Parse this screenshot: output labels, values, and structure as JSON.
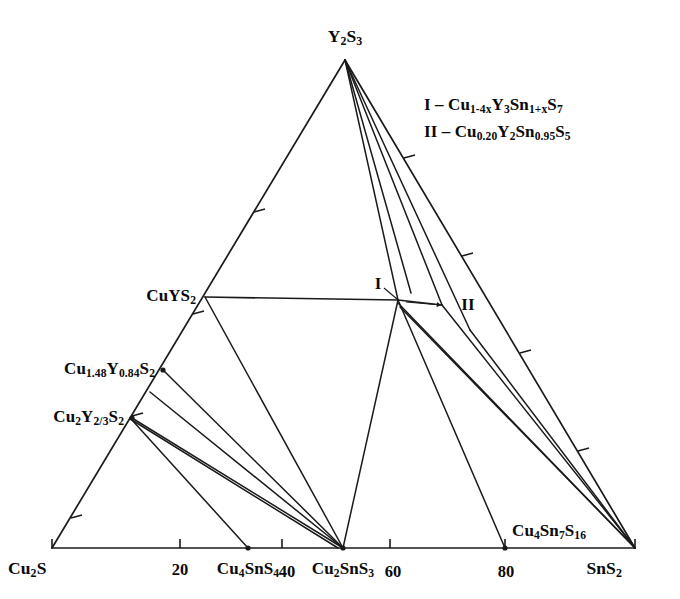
{
  "figure": {
    "kind": "ternary-phase-diagram",
    "system": "Cu2S - Y2S3 - SnS2",
    "background_color": "#ffffff",
    "line_color": "#1a1a1a"
  },
  "corners": [
    {
      "id": "cu2s",
      "name": "Cu2S",
      "html": "Cu<sub>2</sub>S",
      "x": 52,
      "y": 548,
      "label_x": 8,
      "label_y": 570,
      "anchor": "l"
    },
    {
      "id": "y2s3",
      "name": "Y2S3",
      "html": "Y<sub>2</sub>S<sub>3</sub>",
      "x": 345,
      "y": 60,
      "label_x": 345,
      "label_y": 38,
      "anchor": "c"
    },
    {
      "id": "sns2",
      "name": "SnS2",
      "html": "SnS<sub>2</sub>",
      "x": 635,
      "y": 548,
      "label_x": 622,
      "label_y": 570,
      "anchor": "r"
    }
  ],
  "axis_ticks": [
    {
      "value": "20",
      "x": 180,
      "y": 548,
      "label_x": 180,
      "label_y": 570
    },
    {
      "value": "40",
      "x": 282,
      "y": 548,
      "label_x": 287,
      "label_y": 572
    },
    {
      "value": "60",
      "x": 390,
      "y": 548,
      "label_x": 393,
      "label_y": 572
    },
    {
      "value": "80",
      "x": 505,
      "y": 548,
      "label_x": 506,
      "label_y": 572
    }
  ],
  "phase_points": [
    {
      "id": "cuys2",
      "html": "CuYS<sub>2</sub>",
      "x": 205,
      "y": 297,
      "label_x": 196,
      "label_y": 297,
      "anchor": "r",
      "dot": false
    },
    {
      "id": "cu148",
      "html": "Cu<sub>1.48</sub>Y<sub>0.84</sub>S<sub>2</sub>",
      "x": 163,
      "y": 370,
      "label_x": 155,
      "label_y": 370,
      "anchor": "r",
      "dot": true
    },
    {
      "id": "cu2y23",
      "html": "Cu<sub>2</sub>Y<sub>2/3</sub>S<sub>2</sub>",
      "x": 132,
      "y": 418,
      "label_x": 124,
      "label_y": 418,
      "anchor": "r",
      "dot": true
    },
    {
      "id": "cu4sns4",
      "html": "Cu<sub>4</sub>SnS<sub>4</sub>",
      "x": 248,
      "y": 548,
      "label_x": 248,
      "label_y": 570,
      "anchor": "c",
      "dot": true
    },
    {
      "id": "cu2sns3",
      "html": "Cu<sub>2</sub>SnS<sub>3</sub>",
      "x": 343,
      "y": 548,
      "label_x": 343,
      "label_y": 570,
      "anchor": "c",
      "dot": true
    },
    {
      "id": "cu4sn7s16",
      "html": "Cu<sub>4</sub>Sn<sub>7</sub>S<sub>16</sub>",
      "x": 505,
      "y": 548,
      "label_x": 512,
      "label_y": 532,
      "anchor": "l",
      "dot": true
    }
  ],
  "roman_markers": [
    {
      "id": "marker-i",
      "text": "I",
      "x": 398,
      "y": 300,
      "label_x": 378,
      "label_y": 283,
      "leader": {
        "x1": 384,
        "y1": 288,
        "x2": 397,
        "y2": 299
      }
    },
    {
      "id": "marker-ii",
      "text": "II",
      "x": 442,
      "y": 305,
      "label_x": 468,
      "label_y": 304,
      "leader": {
        "x1": 406,
        "y1": 302,
        "x2": 441,
        "y2": 305
      },
      "arrow": true
    }
  ],
  "legend": {
    "line1_html": "I &ndash; Cu<sub>1-4x</sub>Y<sub>3</sub>Sn<sub>1+x</sub>S<sub>7</sub>",
    "line2_html": "II &ndash; Cu<sub>0.20</sub>Y<sub>2</sub>Sn<sub>0.95</sub>S<sub>5</sub>",
    "x": 424,
    "y1": 106,
    "y2": 133
  },
  "chart_data": {
    "type": "ternary-phase-diagram",
    "title": "",
    "components": [
      "Cu2S",
      "Y2S3",
      "SnS2"
    ],
    "axis_tick_values": [
      20,
      40,
      60,
      80
    ],
    "vertices": {
      "Cu2S": [
        52,
        548
      ],
      "Y2S3": [
        345,
        60
      ],
      "SnS2": [
        635,
        548
      ]
    },
    "nodes": [
      {
        "label": "CuYS2",
        "px": [
          205,
          297
        ]
      },
      {
        "label": "Cu1.48Y0.84S2",
        "px": [
          163,
          370
        ]
      },
      {
        "label": "Cu2Y2/3S2",
        "px": [
          132,
          418
        ]
      },
      {
        "label": "I",
        "px": [
          398,
          300
        ]
      },
      {
        "label": "II",
        "px": [
          442,
          305
        ]
      },
      {
        "label": "Cu4SnS4",
        "px": [
          248,
          548
        ]
      },
      {
        "label": "Cu2SnS3",
        "px": [
          343,
          548
        ]
      },
      {
        "label": "Cu4Sn7S16",
        "px": [
          505,
          548
        ]
      }
    ],
    "tie_lines": [
      [
        "Y2S3",
        "CuYS2"
      ],
      [
        "Y2S3",
        "I"
      ],
      [
        "Y2S3",
        "II"
      ],
      [
        "Y2S3",
        "SnS2"
      ],
      [
        "CuYS2",
        "I"
      ],
      [
        "CuYS2",
        "Cu2SnS3"
      ],
      [
        "Cu1.48Y0.84S2",
        "Cu2SnS3"
      ],
      [
        "Cu2Y2/3S2",
        "Cu2SnS3"
      ],
      [
        "Cu2Y2/3S2",
        "Cu4SnS4"
      ],
      [
        "I",
        "II"
      ],
      [
        "I",
        "Cu2SnS3"
      ],
      [
        "I",
        "Cu4Sn7S16"
      ],
      [
        "I",
        "SnS2"
      ],
      [
        "II",
        "SnS2"
      ]
    ]
  },
  "geometry": {
    "edge_ticks_left": [
      {
        "x": 254,
        "y": 212
      },
      {
        "x": 193,
        "y": 314
      },
      {
        "x": 132,
        "y": 416
      },
      {
        "x": 71,
        "y": 518
      }
    ],
    "edge_ticks_right": [
      {
        "x": 404,
        "y": 158
      },
      {
        "x": 462,
        "y": 256
      },
      {
        "x": 520,
        "y": 353
      },
      {
        "x": 578,
        "y": 451
      }
    ],
    "svg_lines": [
      {
        "id": "edge-left",
        "x1": 345,
        "y1": 60,
        "x2": 52,
        "y2": 548,
        "w": 1.7
      },
      {
        "id": "edge-right",
        "x1": 345,
        "y1": 60,
        "x2": 635,
        "y2": 548,
        "w": 1.7
      },
      {
        "id": "edge-bottom",
        "x1": 52,
        "y1": 548,
        "x2": 635,
        "y2": 548,
        "w": 1.7
      },
      {
        "id": "apex-to-i",
        "x1": 345,
        "y1": 60,
        "x2": 398,
        "y2": 300,
        "w": 1.5
      },
      {
        "id": "apex-to-i2",
        "x1": 345,
        "y1": 60,
        "x2": 411,
        "y2": 293,
        "w": 1.5
      },
      {
        "id": "apex-to-ii",
        "x1": 345,
        "y1": 60,
        "x2": 442,
        "y2": 305,
        "w": 1.5
      },
      {
        "id": "apex-to-inner",
        "x1": 345,
        "y1": 60,
        "x2": 470,
        "y2": 330,
        "w": 1.5
      },
      {
        "id": "cuys2-horizontal",
        "x1": 205,
        "y1": 297,
        "x2": 398,
        "y2": 300,
        "w": 1.7
      },
      {
        "id": "cuys2-to-cu2sns3",
        "x1": 205,
        "y1": 297,
        "x2": 343,
        "y2": 548,
        "w": 1.5
      },
      {
        "id": "i-to-ii",
        "x1": 398,
        "y1": 300,
        "x2": 442,
        "y2": 305,
        "w": 1.5
      },
      {
        "id": "i-to-cu2sns3",
        "x1": 398,
        "y1": 300,
        "x2": 343,
        "y2": 548,
        "w": 1.5
      },
      {
        "id": "i-to-cu4sn7",
        "x1": 398,
        "y1": 300,
        "x2": 505,
        "y2": 548,
        "w": 1.5
      },
      {
        "id": "i-to-sns2a",
        "x1": 398,
        "y1": 303,
        "x2": 635,
        "y2": 548,
        "w": 1.5
      },
      {
        "id": "i-to-sns2b",
        "x1": 400,
        "y1": 307,
        "x2": 635,
        "y2": 548,
        "w": 1.5
      },
      {
        "id": "ii-to-sns2",
        "x1": 442,
        "y1": 305,
        "x2": 635,
        "y2": 548,
        "w": 1.5
      },
      {
        "id": "inner-to-sns2",
        "x1": 470,
        "y1": 330,
        "x2": 635,
        "y2": 548,
        "w": 1.5
      },
      {
        "id": "cu148-to-cu2sns3",
        "x1": 163,
        "y1": 370,
        "x2": 343,
        "y2": 548,
        "w": 1.5
      },
      {
        "id": "cu148b-to-cu2sns3",
        "x1": 150,
        "y1": 392,
        "x2": 343,
        "y2": 548,
        "w": 1.5
      },
      {
        "id": "cu2y23-a",
        "x1": 132,
        "y1": 418,
        "x2": 343,
        "y2": 548,
        "w": 1.5
      },
      {
        "id": "cu2y23-b",
        "x1": 132,
        "y1": 420,
        "x2": 338,
        "y2": 548,
        "w": 1.5
      },
      {
        "id": "cu2y23-to-cu4sns4",
        "x1": 132,
        "y1": 420,
        "x2": 248,
        "y2": 548,
        "w": 1.5
      }
    ]
  }
}
